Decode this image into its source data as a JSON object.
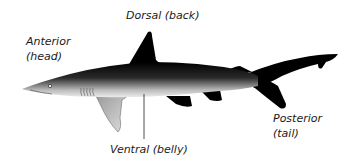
{
  "diagram": {
    "labels": {
      "dorsal": "Dorsal (back)",
      "anterior_line1": "Anterior",
      "anterior_line2": "(head)",
      "ventral": "Ventral (belly)",
      "posterior_line1": "Posterior",
      "posterior_line2": "(tail)"
    },
    "colors": {
      "body_dark": "#000000",
      "body_light": "#e8e8e8",
      "text": "#1a1a1a",
      "background": "#ffffff"
    }
  }
}
